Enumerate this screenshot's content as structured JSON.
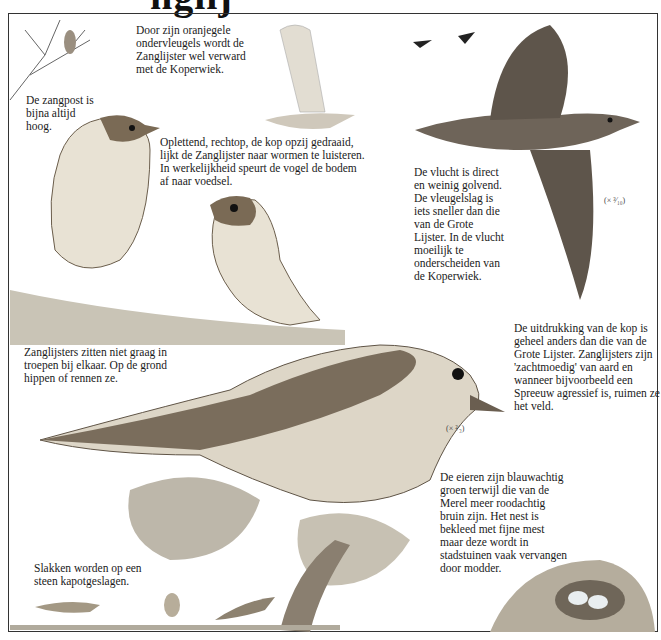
{
  "page": {
    "title_fragment": "nglij",
    "captions": {
      "perch": "De zangpost is bijna altijd hoog.",
      "underwing": "Door zijn oranjegele ondervleugels wordt de Zanglijster wel verward met de Koperwiek.",
      "listening": "Oplettend, rechtop, de kop opzij gedraaid, lijkt de Zanglijster naar wormen te luisteren. In werkelijkheid speurt de vogel de bodem af naar voedsel.",
      "flight": "De vlucht is direct en weinig golvend. De vleugelslag is iets sneller dan die van de Grote Lijster. In de vlucht moeilijk te onderscheiden van de Koperwiek.",
      "ground": "Zanglijsters zitten niet graag in troepen bij elkaar. Op de grond hippen of rennen ze.",
      "head": "De uitdrukking van de kop is geheel anders dan die van de Grote Lijster. Zanglijsters zijn 'zachtmoedig' van aard en wanneer bijvoorbeeld een Spreeuw agressief is, ruimen ze het veld.",
      "eggs": "De eieren zijn blauwachtig groen terwijl die van de Merel meer roodachtig bruin zijn. Het nest is bekleed met fijne mest maar deze wordt in stadstuinen vaak vervangen door modder.",
      "snails": "Slakken worden op een steen kapotgeslagen."
    },
    "scales": {
      "flight": "(× ³⁄₁₀)",
      "main": "(× ²⁄₃)"
    }
  }
}
